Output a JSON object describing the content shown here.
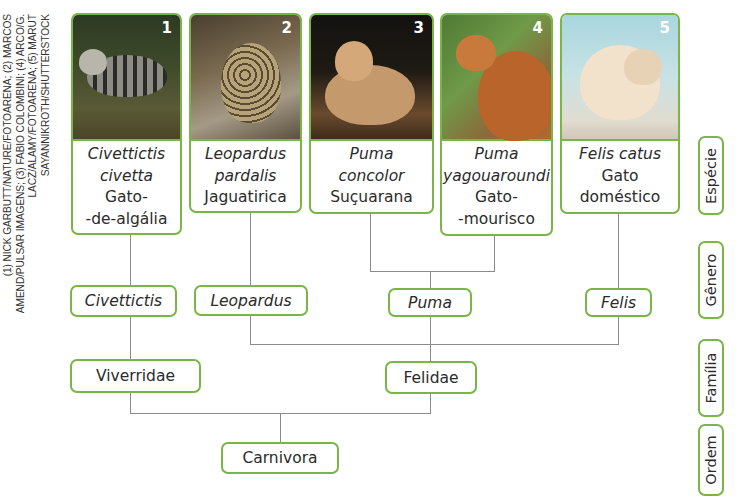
{
  "credits": "(1) NICK GARBUTT/NATURE/FOTOARENA; (2) MARCOS AMEND/PULSAR IMAGENS; (3) FABIO COLOMBINI; (4) ARCO/G. LACZ/ALAMY/FOTOARENA; (5) MARUT SAYANNIKROTH/SHUTTERSTOCK",
  "colors": {
    "border": "#79b547",
    "line": "#8a8a8a",
    "text": "#2b2b2b"
  },
  "species": [
    {
      "number": "1",
      "scientific": [
        "Civettictis",
        "civetta"
      ],
      "common": [
        "Gato-",
        "-de-algália"
      ],
      "photo": "civet-photo"
    },
    {
      "number": "2",
      "scientific": [
        "Leopardus",
        "pardalis"
      ],
      "common": [
        "Jaguatirica"
      ],
      "photo": "ocelot-photo"
    },
    {
      "number": "3",
      "scientific": [
        "Puma",
        "concolor"
      ],
      "common": [
        "Suçuarana"
      ],
      "photo": "puma-photo"
    },
    {
      "number": "4",
      "scientific": [
        "Puma",
        "yagouaroundi"
      ],
      "common": [
        "Gato-",
        "-mourisco"
      ],
      "photo": "jaguarundi-photo"
    },
    {
      "number": "5",
      "scientific": [
        "Felis catus"
      ],
      "common": [
        "Gato",
        "doméstico"
      ],
      "photo": "domestic-cat-photo"
    }
  ],
  "genera": [
    "Civettictis",
    "Leopardus",
    "Puma",
    "Felis"
  ],
  "families": [
    "Viverridae",
    "Felidae"
  ],
  "order": "Carnivora",
  "ranks": [
    "Espécie",
    "Gênero",
    "Família",
    "Ordem"
  ]
}
